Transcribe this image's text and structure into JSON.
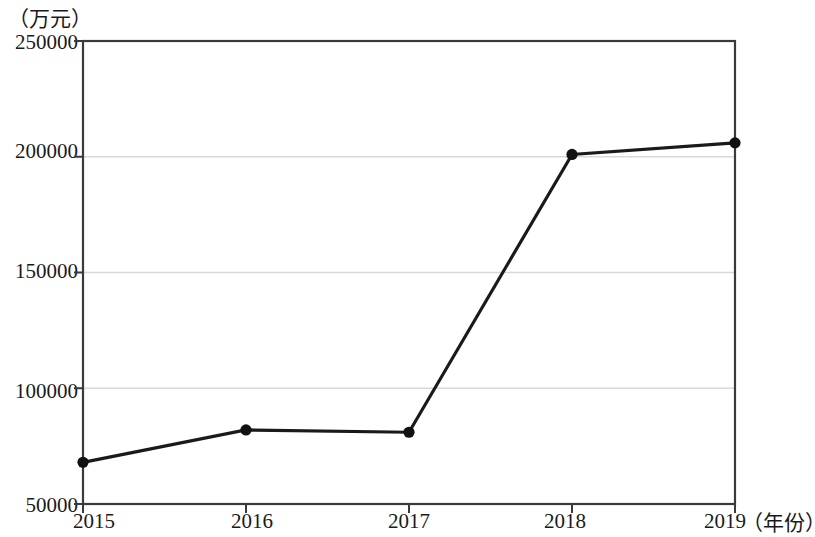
{
  "chart_data": {
    "type": "line",
    "title": "",
    "subtitle": "",
    "xlabel": "（年份）",
    "ylabel": "（万元）",
    "categories": [
      "2015",
      "2016",
      "2017",
      "2018",
      "2019"
    ],
    "values": [
      68000,
      82000,
      81000,
      201000,
      206000
    ],
    "series": [
      {
        "name": "",
        "values": [
          68000,
          82000,
          81000,
          201000,
          206000
        ]
      }
    ],
    "x_tick_labels": [
      "2015",
      "2016",
      "2017",
      "2018",
      "2019"
    ],
    "y_tick_labels": [
      "250000",
      "200000",
      "150000",
      "100000",
      "50000"
    ],
    "y_ticks": [
      250000,
      200000,
      150000,
      100000,
      50000
    ],
    "ylim": [
      50000,
      250000
    ],
    "xlim": [
      2015,
      2019
    ],
    "grid": true,
    "grid_axis": "y",
    "legend": false,
    "legend_position": "none",
    "marker": "filled-circle",
    "line_color": "#1a1a1a",
    "marker_color": "#111111",
    "grid_color": "#d8d8d8",
    "axis_color": "#3a3a3a",
    "background_color": "#ffffff",
    "annotations": []
  },
  "axes": {
    "y_unit": "（万元）",
    "x_unit": "（年份）"
  }
}
